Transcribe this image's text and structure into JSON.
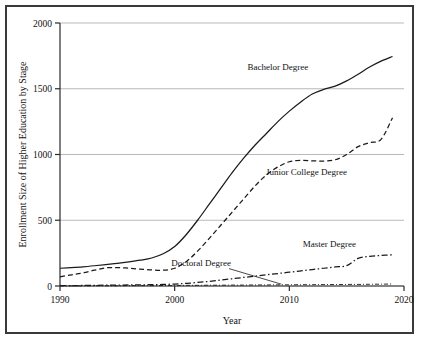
{
  "chart_data": {
    "type": "line",
    "title": "",
    "xlabel": "Year",
    "ylabel": "Enrollment Size of Higher Education by Stage",
    "xlim": [
      1990,
      2020
    ],
    "ylim": [
      0,
      2000
    ],
    "xticks": [
      1990,
      2000,
      2010,
      2020
    ],
    "xtick_labels": [
      "1990",
      "2000",
      "2010",
      "2020"
    ],
    "yticks": [
      0,
      500,
      1000,
      1500,
      2000
    ],
    "ytick_labels": [
      "0",
      "500",
      "1000",
      "1500",
      "2000"
    ],
    "grid": "horizontal",
    "legend_position": "inline-annotations",
    "x": [
      1990,
      1991,
      1992,
      1993,
      1994,
      1995,
      1996,
      1997,
      1998,
      1999,
      2000,
      2001,
      2002,
      2003,
      2004,
      2005,
      2006,
      2007,
      2008,
      2009,
      2010,
      2011,
      2012,
      2013,
      2014,
      2015,
      2016,
      2017,
      2018,
      2019
    ],
    "series": [
      {
        "name": "Bachelor Degree",
        "style": "solid",
        "color": "#1a1a1a",
        "label_x": 2009.0,
        "label_y": 1640,
        "values": [
          135,
          140,
          146,
          154,
          163,
          172,
          183,
          196,
          213,
          245,
          300,
          390,
          500,
          620,
          740,
          860,
          970,
          1070,
          1160,
          1250,
          1330,
          1400,
          1460,
          1495,
          1520,
          1560,
          1610,
          1665,
          1710,
          1745
        ]
      },
      {
        "name": "Junior College Degree",
        "style": "dashed",
        "color": "#1a1a1a",
        "label_x": 2011.5,
        "label_y": 845,
        "values": [
          70,
          85,
          100,
          120,
          138,
          140,
          135,
          128,
          122,
          120,
          135,
          185,
          265,
          360,
          460,
          560,
          660,
          760,
          845,
          905,
          945,
          955,
          952,
          950,
          960,
          1000,
          1060,
          1090,
          1115,
          1280
        ]
      },
      {
        "name": "Master Degree",
        "style": "dashdot",
        "color": "#1a1a1a",
        "label_x": 2013.5,
        "label_y": 300,
        "values": [
          2,
          3,
          4,
          5,
          6,
          7,
          8,
          9,
          10,
          12,
          15,
          20,
          27,
          35,
          45,
          55,
          65,
          75,
          85,
          95,
          105,
          115,
          125,
          135,
          145,
          155,
          210,
          225,
          232,
          238
        ]
      },
      {
        "name": "Doctoral Degree",
        "style": "dashdotfine",
        "color": "#1a1a1a",
        "label_x": 2002.3,
        "label_y": 155,
        "leader_to_x": 2009.3,
        "leader_to_y": 14,
        "values": [
          1,
          1,
          1,
          2,
          2,
          2,
          3,
          3,
          3,
          4,
          4,
          5,
          5,
          6,
          6,
          7,
          7,
          8,
          8,
          9,
          9,
          10,
          10,
          11,
          11,
          12,
          12,
          13,
          14,
          15
        ]
      }
    ]
  }
}
